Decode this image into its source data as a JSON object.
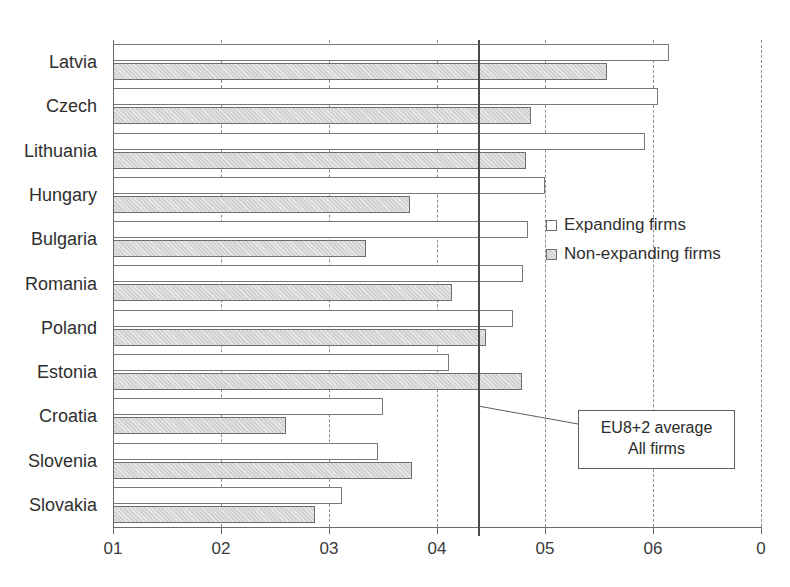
{
  "chart_data": {
    "type": "bar",
    "orientation": "horizontal",
    "title": "",
    "xlabel": "",
    "ylabel": "",
    "xlim": [
      0.1,
      0.7
    ],
    "grid": true,
    "grid_axis": "x",
    "legend_position": "middle-right",
    "categories": [
      "Latvia",
      "Czech",
      "Lithuania",
      "Hungary",
      "Bulgaria",
      "Romania",
      "Poland",
      "Estonia",
      "Croatia",
      "Slovenia",
      "Slovakia"
    ],
    "series": [
      {
        "name": "Expanding firms",
        "color": "#ffffff",
        "values": [
          0.615,
          0.605,
          0.593,
          0.5,
          0.484,
          0.48,
          0.47,
          0.411,
          0.35,
          0.345,
          0.312
        ]
      },
      {
        "name": "Non-expanding firms",
        "color": "#d2d2d2",
        "values": [
          0.557,
          0.487,
          0.482,
          0.375,
          0.334,
          0.414,
          0.445,
          0.479,
          0.26,
          0.377,
          0.287
        ]
      }
    ],
    "xticks": [
      0.1,
      0.2,
      0.3,
      0.4,
      0.5,
      0.6,
      0.7
    ],
    "xtick_labels": [
      "01",
      "02",
      "03",
      "04",
      "05",
      "06",
      "0"
    ],
    "reference_line": {
      "value": 0.438,
      "label_line_1": "EU8+2 average",
      "label_line_2": "All firms"
    }
  },
  "legend": {
    "items": [
      {
        "label": "Expanding firms",
        "swatch": "white-square"
      },
      {
        "label": "Non-expanding firms",
        "swatch": "gray-square"
      }
    ]
  },
  "annotation": {
    "line1": "EU8+2 average",
    "line2": "All firms"
  },
  "colors": {
    "expanding_fill": "#ffffff",
    "nonexpanding_fill": "#d2d2d2",
    "bar_outline": "#787878",
    "gridline": "#8d8d8d",
    "reference_line": "#4a4a4a",
    "axis": "#6a6a6a",
    "text": "#2f2f2f"
  }
}
